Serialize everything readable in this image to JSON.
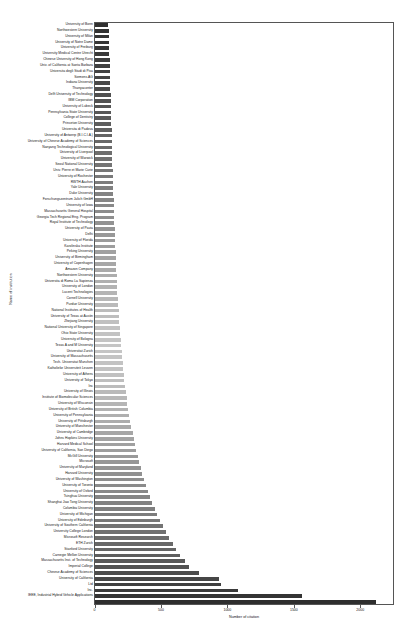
{
  "chart_data": {
    "type": "bar",
    "orientation": "horizontal",
    "title": "",
    "xlabel": "Number of citation",
    "ylabel": "Name of institution",
    "xlim": [
      0,
      2250
    ],
    "ylim_note": "categorical, one row per institution, sorted ascending from top to bottom",
    "xticks": [
      0,
      500,
      1000,
      1500,
      2000
    ],
    "xtick_labels": [
      "0",
      "500",
      "1000",
      "1500",
      "2000"
    ],
    "grid": false,
    "legend": "none",
    "bar_colormap": "grayscale gradient: dark at top rows, lightest in middle rows, dark again at bottom rows",
    "categories": [
      "University of Bonn",
      "Northwestern University",
      "University of Milan",
      "University of Notre Dame",
      "University of Freiburg",
      "University Medical Centre Utrecht",
      "Chinese University of Hong Kong",
      "Univ. of California at Santa Barbara",
      "Universita degli Studi di Pisa",
      "Siemens AG",
      "Indiana University",
      "Thanyaconter",
      "Delft University of Technology",
      "IBM Corporation",
      "University of Lubeck",
      "Pennsylvania State University",
      "College of Dentistry",
      "Princeton University",
      "Universita di Padova",
      "University of Antwerp (B.I.C.I.A.)",
      "University of Chinese Academy of Sciences",
      "Nanyang Technological University",
      "University of Liverpool",
      "University of Warwick",
      "Seoul National University",
      "Univ. Pierre et Marie Curie",
      "University of Rochester",
      "RWTH Aachen",
      "Yale University",
      "Duke University",
      "Forschungszentrum Julich GmbH",
      "University of Iowa",
      "Massachusetts General Hospital",
      "Georgia Tech Regional Eng. Program",
      "Royal Institute of Technology",
      "University of Pavia",
      "Delhi",
      "University of Florida",
      "Karolinska Institute",
      "Peking University",
      "University of Birmingham",
      "University of Copenhagen",
      "Amazon Company",
      "Northwestern University",
      "Universita di Roma La Sapienza",
      "University of London",
      "Lucent Technologies",
      "Cornell University",
      "Purdue University",
      "National Institutes of Health",
      "University of Texas at Austin",
      "Zhejiang University",
      "National University of Singapore",
      "Ohio State University",
      "University of Bologna",
      "Texas A and M University",
      "Universitat Zurich",
      "University of Massachusetts",
      "Tech. Universitat Munchen",
      "Katholieke Universiteit Leuven",
      "University of Athens",
      "University of Tokyo",
      "Inc",
      "University of Illinois",
      "Institute of Biomolecular Sciences",
      "University of Wisconsin",
      "University of British Columbia",
      "University of Pennsylvania",
      "University of Pittsburgh",
      "University of Manchester",
      "University of Cambridge",
      "Johns Hopkins University",
      "Harvard Medical School",
      "University of California, San Diego",
      "McGill University",
      "Microsoft",
      "University of Maryland",
      "Harvard University",
      "University of Washington",
      "University of Toronto",
      "University of Oxford",
      "Tsinghua University",
      "Shanghai Jiao Tong University",
      "Columbia University",
      "University of Michigan",
      "University of Edinburgh",
      "University of Southern California",
      "University College London",
      "Microsoft Research",
      "ETH Zurich",
      "Stanford University",
      "Carnegie Mellon University",
      "Massachusetts Inst. of Technology",
      "Imperial College",
      "Chinese Academy of Sciences",
      "University of California",
      "Ltd",
      "Inc.",
      "IEEE, Industrial Hybrid Vehicle Applications",
      ""
    ],
    "values": [
      105,
      106,
      107,
      108,
      110,
      112,
      113,
      115,
      116,
      118,
      119,
      120,
      121,
      122,
      123,
      125,
      126,
      127,
      128,
      130,
      131,
      132,
      133,
      134,
      135,
      137,
      138,
      139,
      140,
      142,
      143,
      145,
      146,
      148,
      150,
      152,
      153,
      155,
      157,
      159,
      161,
      163,
      165,
      167,
      169,
      171,
      173,
      176,
      178,
      181,
      184,
      187,
      190,
      193,
      196,
      200,
      204,
      208,
      212,
      216,
      220,
      225,
      230,
      236,
      242,
      248,
      255,
      262,
      270,
      278,
      286,
      295,
      304,
      314,
      325,
      336,
      348,
      360,
      373,
      387,
      402,
      418,
      435,
      453,
      472,
      492,
      514,
      537,
      562,
      588,
      616,
      646,
      678,
      712,
      790,
      940,
      950,
      1080,
      1560,
      2120
    ],
    "bar_shades": [
      "#303030",
      "#323232",
      "#343434",
      "#363636",
      "#383838",
      "#3a3a3a",
      "#3d3d3d",
      "#404040",
      "#434343",
      "#464646",
      "#494949",
      "#4c4c4c",
      "#4f4f4f",
      "#525252",
      "#555555",
      "#585858",
      "#5b5b5b",
      "#5e5e5e",
      "#616161",
      "#646464",
      "#686868",
      "#6b6b6b",
      "#6e6e6e",
      "#717171",
      "#747474",
      "#777777",
      "#7a7a7a",
      "#7d7d7d",
      "#808080",
      "#838383",
      "#868686",
      "#898989",
      "#8c8c8c",
      "#8f8f8f",
      "#929292",
      "#959595",
      "#989898",
      "#9b9b9b",
      "#9e9e9e",
      "#a1a1a1",
      "#a4a4a4",
      "#a7a7a7",
      "#aaaaaa",
      "#adadad",
      "#b0b0b0",
      "#b3b3b3",
      "#b5b5b5",
      "#b8b8b8",
      "#bababa",
      "#bcbcbc",
      "#bebebe",
      "#c0c0c0",
      "#c2c2c2",
      "#c3c3c3",
      "#c4c4c4",
      "#c5c5c5",
      "#c5c5c5",
      "#c4c4c4",
      "#c3c3c3",
      "#c2c2c2",
      "#c0c0c0",
      "#bebebe",
      "#bcbcbc",
      "#bababa",
      "#b8b8b8",
      "#b5b5b5",
      "#b2b2b2",
      "#afafaf",
      "#acacac",
      "#a9a9a9",
      "#a6a6a6",
      "#a3a3a3",
      "#a0a0a0",
      "#9d9d9d",
      "#9a9a9a",
      "#979797",
      "#949494",
      "#919191",
      "#8e8e8e",
      "#8b8b8b",
      "#888888",
      "#858585",
      "#828282",
      "#7f7f7f",
      "#7c7c7c",
      "#787878",
      "#747474",
      "#707070",
      "#6c6c6c",
      "#686868",
      "#646464",
      "#5e5e5e",
      "#585858",
      "#525252",
      "#4c4c4c",
      "#464646",
      "#404040",
      "#3a3a3a",
      "#343434",
      "#2e2e2e"
    ]
  }
}
